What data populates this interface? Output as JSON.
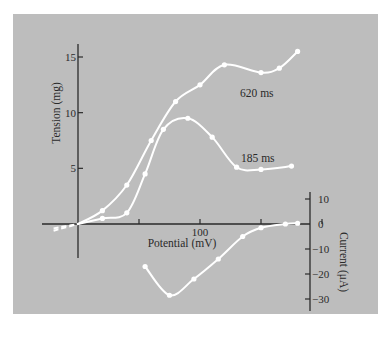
{
  "figure": {
    "background_color": "#bdbdbd",
    "page_color": "#ffffff",
    "curve_color": "#ffffff",
    "axis_color": "#2a2a2a"
  },
  "chart_data": {
    "type": "line",
    "title": "",
    "xlabel": "Potential (mV)",
    "x_ticks": [
      0,
      50,
      100,
      150,
      200
    ],
    "x_tick_labels": [
      "",
      "",
      "100",
      "",
      ""
    ],
    "xlim": [
      -30,
      210
    ],
    "left_axis": {
      "label": "Tension (mg)",
      "ticks": [
        5,
        10,
        15
      ],
      "tick_labels": [
        "5",
        "10",
        "15"
      ],
      "ylim": [
        -1,
        16
      ]
    },
    "right_axis": {
      "label": "Current (μA)",
      "ticks": [
        10,
        0,
        -10,
        -20,
        -30
      ],
      "tick_labels": [
        "10",
        "0",
        "−10",
        "−20",
        "−30"
      ],
      "ylim": [
        -32,
        12
      ]
    },
    "grid": false,
    "legend": "inline annotations",
    "annotations": [
      "620 ms",
      "185 ms"
    ],
    "series": [
      {
        "name": "620 ms",
        "axis": "left",
        "x": [
          -20,
          0,
          20,
          40,
          60,
          80,
          100,
          120,
          150,
          165,
          180
        ],
        "values": [
          -0.6,
          0,
          1.2,
          3.5,
          7.5,
          11,
          12.5,
          14.3,
          13.6,
          14,
          15.5
        ]
      },
      {
        "name": "185 ms",
        "axis": "left",
        "x": [
          -20,
          0,
          20,
          40,
          55,
          70,
          90,
          110,
          130,
          150,
          175
        ],
        "values": [
          -0.4,
          0,
          0.5,
          1,
          4.5,
          8.5,
          9.5,
          7.8,
          5.1,
          4.9,
          5.2
        ]
      },
      {
        "name": "Current",
        "axis": "right",
        "x": [
          55,
          75,
          95,
          115,
          135,
          150,
          170,
          180
        ],
        "values": [
          -17,
          -28.5,
          -22,
          -14,
          -5,
          -1.5,
          0,
          0.3
        ]
      }
    ]
  }
}
